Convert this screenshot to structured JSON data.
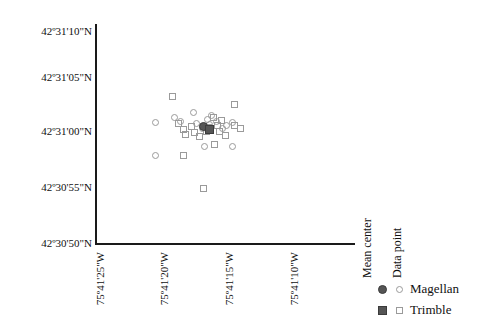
{
  "chart_data": {
    "type": "scatter",
    "title": "",
    "xlabel": "",
    "ylabel": "",
    "grid": false,
    "xlim": [
      -75.690972,
      -75.685833
    ],
    "ylim": [
      42.513889,
      42.519444
    ],
    "x_ticks": [
      {
        "label": "75º41'25\"W",
        "value": -75.690278
      },
      {
        "label": "75º41'20\"W",
        "value": -75.688889
      },
      {
        "label": "75º41'15\"W",
        "value": -75.6875
      },
      {
        "label": "75º41'10\"W",
        "value": -75.686111
      }
    ],
    "y_ticks": [
      {
        "label": "42º31'10\"N",
        "value": 42.519444
      },
      {
        "label": "42º31'05\"N",
        "value": 42.518056
      },
      {
        "label": "42º31'00\"N",
        "value": 42.516667
      },
      {
        "label": "42º30'55\"N",
        "value": 42.515278
      },
      {
        "label": "42º30'50\"N",
        "value": 42.513889
      }
    ],
    "series": [
      {
        "name": "Magellan",
        "marker": "circle-open",
        "color": "#9a9a9a",
        "points": [
          [
            60,
            98
          ],
          [
            60,
            131
          ],
          [
            79,
            93
          ],
          [
            85,
            97
          ],
          [
            98,
            88
          ],
          [
            101,
            99
          ],
          [
            107,
            104
          ],
          [
            112,
            95
          ],
          [
            114,
            100
          ],
          [
            116,
            91
          ],
          [
            121,
            97
          ],
          [
            127,
            104
          ],
          [
            131,
            101
          ],
          [
            137,
            98
          ],
          [
            109,
            122
          ],
          [
            137,
            122
          ]
        ]
      },
      {
        "name": "Trimble",
        "marker": "square-open",
        "color": "#9a9a9a",
        "points": [
          [
            77,
            72
          ],
          [
            83,
            99
          ],
          [
            88,
            105
          ],
          [
            90,
            110
          ],
          [
            96,
            102
          ],
          [
            99,
            108
          ],
          [
            104,
            112
          ],
          [
            111,
            107
          ],
          [
            113,
            103
          ],
          [
            118,
            93
          ],
          [
            122,
            101
          ],
          [
            124,
            107
          ],
          [
            126,
            96
          ],
          [
            130,
            111
          ],
          [
            139,
            80
          ],
          [
            139,
            101
          ],
          [
            119,
            120
          ],
          [
            88,
            131
          ],
          [
            108,
            164
          ],
          [
            145,
            104
          ]
        ]
      },
      {
        "name": "Magellan mean center",
        "marker": "circle-filled",
        "color": "#555555",
        "points": [
          [
            108,
            102
          ]
        ]
      },
      {
        "name": "Trimble mean center",
        "marker": "square-filled",
        "color": "#555555",
        "points": [
          [
            114,
            105
          ]
        ]
      }
    ]
  },
  "axes": {
    "y_tick_labels": [
      "42º31'10\"N",
      "42º31'05\"N",
      "42º31'00\"N",
      "42º30'55\"N",
      "42º30'50\"N"
    ],
    "x_tick_labels": [
      "75º41'25\"W",
      "75º41'20\"W",
      "75º41'15\"W",
      "75º41'10\"W"
    ]
  },
  "legend": {
    "headers": [
      "Mean center",
      "Data point"
    ],
    "rows": [
      {
        "label": "Magellan",
        "mean_marker": "circle-filled",
        "data_marker": "circle-open"
      },
      {
        "label": "Trimble",
        "mean_marker": "square-filled",
        "data_marker": "square-open"
      }
    ]
  }
}
